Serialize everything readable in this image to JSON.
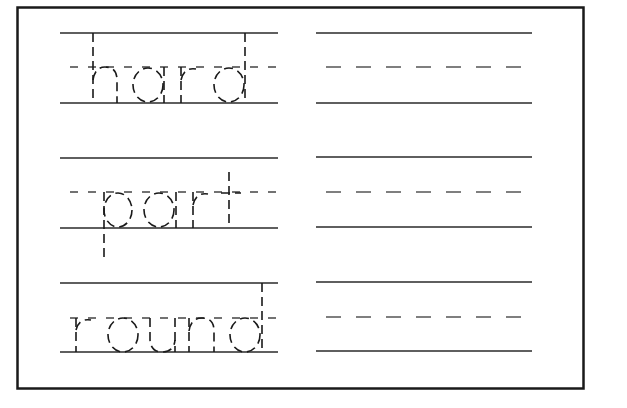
{
  "worksheet": {
    "type": "handwriting tracing practice",
    "colors": {
      "ink": "#1a1a1a",
      "rule": "#2a2a2a",
      "dash": "#555555",
      "background": "#ffffff"
    },
    "rows": [
      {
        "word": "hard",
        "trace_label": "hard",
        "practice_label": "blank practice line"
      },
      {
        "word": "part",
        "trace_label": "part",
        "practice_label": "blank practice line"
      },
      {
        "word": "round",
        "trace_label": "round",
        "practice_label": "blank practice line"
      }
    ]
  }
}
